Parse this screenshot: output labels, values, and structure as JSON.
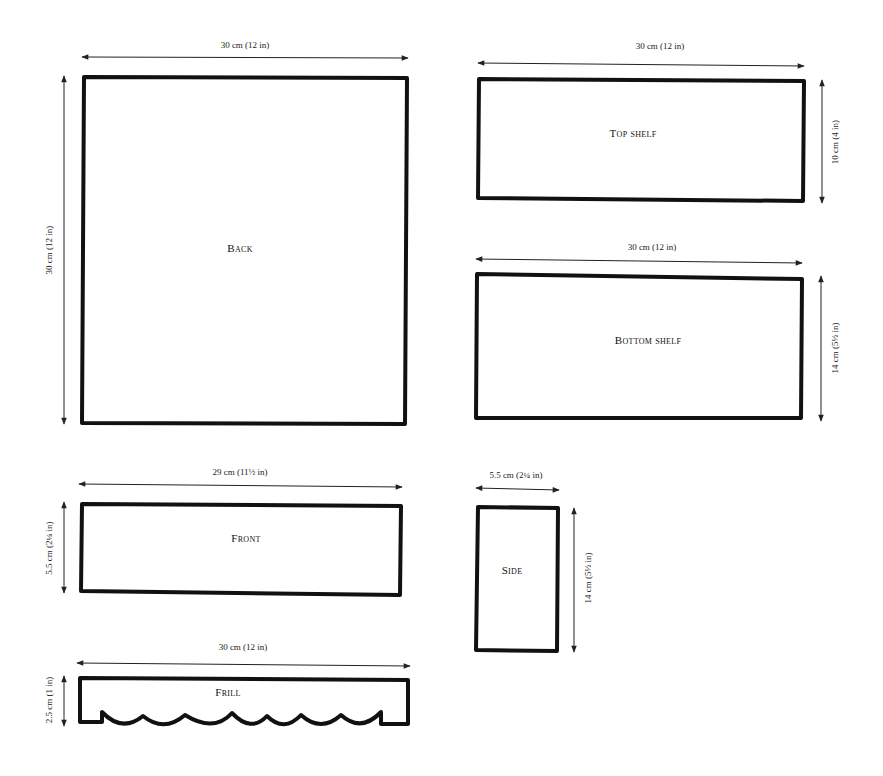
{
  "pieces": {
    "back": {
      "label": "Back",
      "width_dim": "30 cm (12 in)",
      "height_dim": "30 cm (12 in)"
    },
    "top_shelf": {
      "label": "Top shelf",
      "width_dim": "30 cm (12 in)",
      "height_dim": "10 cm (4 in)"
    },
    "bottom_shelf": {
      "label": "Bottom shelf",
      "width_dim": "30 cm (12 in)",
      "height_dim": "14 cm (5½ in)"
    },
    "front": {
      "label": "Front",
      "width_dim": "29 cm (11½ in)",
      "height_dim": "5.5 cm (2¼ in)"
    },
    "side": {
      "label": "Side",
      "width_dim": "5.5 cm (2¼ in)",
      "height_dim": "14 cm (5½ in)"
    },
    "frill": {
      "label": "Frill",
      "width_dim": "30 cm (12 in)",
      "height_dim": "2.5 cm (1 in)"
    }
  },
  "colors": {
    "line": "#111111",
    "background": "#ffffff"
  }
}
